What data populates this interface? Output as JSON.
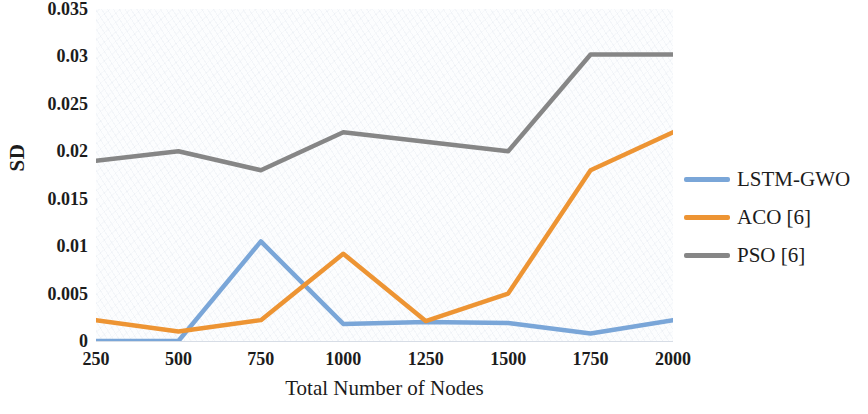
{
  "chart_data": {
    "type": "line",
    "title": "",
    "xlabel": "Total Number of Nodes",
    "ylabel": "SD",
    "categories": [
      "250",
      "500",
      "750",
      "1000",
      "1250",
      "1500",
      "1750",
      "2000"
    ],
    "x_values": [
      250,
      500,
      750,
      1000,
      1250,
      1500,
      1750,
      2000
    ],
    "xlim": [
      250,
      2000
    ],
    "ylim": [
      0,
      0.035
    ],
    "y_ticks": [
      "0",
      "0.005",
      "0.01",
      "0.015",
      "0.02",
      "0.025",
      "0.03",
      "0.035"
    ],
    "y_tick_values": [
      0,
      0.005,
      0.01,
      0.015,
      0.02,
      0.025,
      0.03,
      0.035
    ],
    "grid": false,
    "legend_position": "right",
    "series": [
      {
        "name": "LSTM-GWO",
        "color": "#7aa6d8",
        "values": [
          0,
          0,
          0.0105,
          0.0018,
          0.002,
          0.0019,
          0.0008,
          0.0022
        ]
      },
      {
        "name": "ACO [6]",
        "color": "#ed9433",
        "values": [
          0.0022,
          0.001,
          0.0022,
          0.0092,
          0.0021,
          0.005,
          0.018,
          0.022
        ]
      },
      {
        "name": "PSO [6]",
        "color": "#868686",
        "values": [
          0.019,
          0.02,
          0.018,
          0.022,
          0.021,
          0.02,
          0.0302,
          0.0302
        ]
      }
    ]
  },
  "axes": {
    "y_title": "SD",
    "x_title": "Total Number of Nodes"
  },
  "legend": {
    "entries": [
      {
        "label": "LSTM-GWO",
        "color": "#7aa6d8",
        "swatch": "line-swatch-lstm-gwo"
      },
      {
        "label": "ACO [6]",
        "color": "#ed9433",
        "swatch": "line-swatch-aco"
      },
      {
        "label": "PSO [6]",
        "color": "#868686",
        "swatch": "line-swatch-pso"
      }
    ]
  }
}
